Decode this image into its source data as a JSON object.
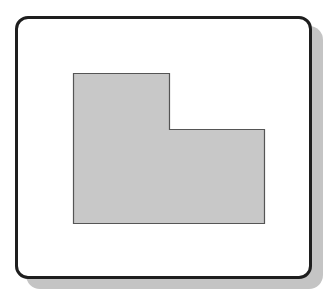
{
  "diagram": {
    "type": "l-shaped-region-in-frame",
    "frame": {
      "border_color": "#1e1e1e",
      "background": "#ffffff",
      "shadow_color": "#c4c4c4"
    },
    "shape": {
      "fill": "#c8c8c8",
      "stroke": "#555555",
      "points": "73.5,73.5 169.5,73.5 169.5,129.5 264.5,129.5 264.5,223.5 73.5,223.5"
    }
  }
}
